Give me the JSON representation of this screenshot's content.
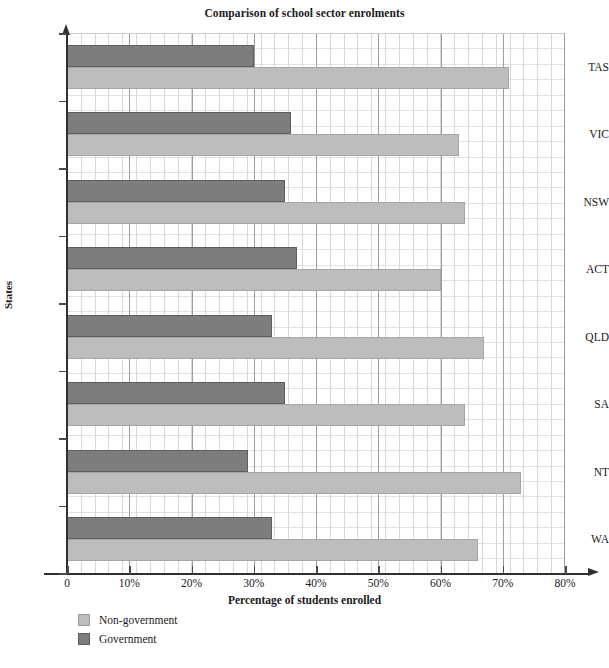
{
  "chart_data": {
    "type": "bar",
    "orientation": "horizontal",
    "title": "Comparison of school sector enrolments",
    "xlabel": "Percentage of students enrolled",
    "ylabel": "States",
    "categories": [
      "TAS",
      "VIC",
      "NSW",
      "ACT",
      "QLD",
      "SA",
      "NT",
      "WA"
    ],
    "series": [
      {
        "name": "Non-government",
        "color": "#bdbdbd",
        "values": [
          71,
          63,
          64,
          60,
          67,
          64,
          73,
          66
        ]
      },
      {
        "name": "Government",
        "color": "#7d7d7d",
        "values": [
          30,
          36,
          35,
          37,
          33,
          35,
          29,
          33
        ]
      }
    ],
    "xlim": [
      0,
      80
    ],
    "x_ticks": [
      0,
      10,
      20,
      30,
      40,
      50,
      60,
      70,
      80
    ],
    "x_tick_labels": [
      "0",
      "10%",
      "20%",
      "30%",
      "40%",
      "50%",
      "60%",
      "70%",
      "80%"
    ],
    "grid": true,
    "legend_position": "bottom-left"
  },
  "legend": {
    "items": [
      {
        "label": "Non-government",
        "swatch": "nongov"
      },
      {
        "label": "Government",
        "swatch": "gov"
      }
    ]
  }
}
